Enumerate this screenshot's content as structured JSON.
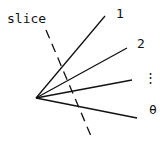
{
  "diagram": {
    "slice_label": "slice",
    "ray_labels": [
      "1",
      "2",
      "⋮",
      "θ"
    ],
    "origin": [
      36,
      98
    ],
    "rays": [
      [
        105,
        16
      ],
      [
        127,
        48
      ],
      [
        132,
        80
      ],
      [
        137,
        118
      ]
    ],
    "slice_line": [
      [
        46,
        30
      ],
      [
        91,
        136
      ]
    ],
    "stroke_color": "#111111"
  }
}
